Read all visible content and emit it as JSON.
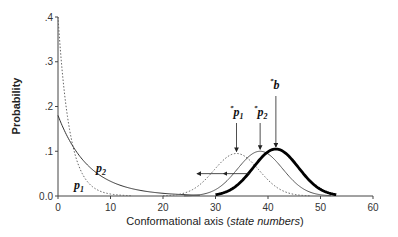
{
  "chart_data": {
    "type": "line",
    "title": "",
    "xlabel": "Conformational axis (state numbers)",
    "xlabel_plain": "Conformational axis (",
    "xlabel_italic": "state numbers",
    "xlabel_close": ")",
    "ylabel": "Probability",
    "xlim": [
      0,
      60
    ],
    "ylim": [
      0,
      0.4
    ],
    "x_ticks": [
      0,
      10,
      20,
      30,
      40,
      50,
      60
    ],
    "x_tick_labels": [
      "0",
      "10",
      "20",
      "30",
      "40",
      "50",
      "60"
    ],
    "y_ticks": [
      0,
      0.1,
      0.2,
      0.3,
      0.4
    ],
    "y_tick_labels": [
      "0.0",
      ".1",
      ".2",
      ".3",
      ".4"
    ],
    "grid": false,
    "legend": "none (inline curve labels)",
    "series": [
      {
        "name": "p1",
        "style": "dotted",
        "form": "exponential decay",
        "y0": 0.4,
        "decay_rate": 0.45,
        "x": [
          0,
          1,
          2,
          3,
          4,
          5,
          6,
          8,
          10,
          12
        ],
        "values": [
          0.4,
          0.26,
          0.16,
          0.1,
          0.066,
          0.042,
          0.027,
          0.011,
          0.004,
          0.0
        ]
      },
      {
        "name": "p2",
        "style": "solid thin",
        "form": "exponential decay",
        "y0": 0.18,
        "decay_rate": 0.17,
        "x": [
          0,
          2,
          4,
          6,
          8,
          10,
          12,
          15,
          20,
          25
        ],
        "values": [
          0.18,
          0.128,
          0.091,
          0.065,
          0.046,
          0.033,
          0.023,
          0.014,
          0.006,
          0.0
        ]
      },
      {
        "name": "*p1",
        "style": "dotted",
        "form": "gaussian",
        "mean": 34,
        "sd": 4.3,
        "peak": 0.095
      },
      {
        "name": "*p2",
        "style": "solid thin",
        "form": "gaussian",
        "mean": 38.5,
        "sd": 4.3,
        "peak": 0.1
      },
      {
        "name": "*b",
        "style": "solid thick",
        "form": "gaussian",
        "mean": 41.5,
        "sd": 4.3,
        "peak": 0.105
      }
    ],
    "annotations": [
      {
        "label": "p2",
        "x": 7.5,
        "y": 0.055
      },
      {
        "label": "p1",
        "x": 2,
        "y": 0.02
      },
      {
        "label": "*p1",
        "x": 34,
        "y": 0.17,
        "arrow_to_peak": true
      },
      {
        "label": "*p2",
        "x": 38.5,
        "y": 0.17,
        "arrow_to_peak": true
      },
      {
        "label": "*b",
        "x": 41.5,
        "y": 0.22,
        "arrow_to_peak": true
      },
      {
        "label": "leftward arrows",
        "from_x": 34,
        "to_x": 27,
        "y": 0.05
      }
    ]
  },
  "labels": {
    "p1": "p",
    "p1_sub": "1",
    "p2": "p",
    "p2_sub": "2",
    "sp1_star": "*",
    "sp1": "p",
    "sp1_sub": "1",
    "sp2_star": "*",
    "sp2": "p",
    "sp2_sub": "2",
    "sb_star": "*",
    "sb": "b"
  }
}
